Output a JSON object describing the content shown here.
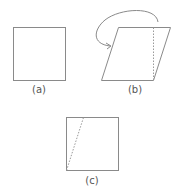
{
  "figures": [
    {
      "id": "a",
      "label": "(a)",
      "shape": "square"
    },
    {
      "id": "b",
      "label": "(b)",
      "shape": "parallelogram",
      "annotation": "curved arrow moving right triangle to left side; dotted vertical cut"
    },
    {
      "id": "c",
      "label": "(c)",
      "shape": "square",
      "annotation": "dotted diagonal from bottom-left corner"
    }
  ],
  "colors": {
    "stroke": "#8a8a8a",
    "dotted": "#9a9a9a"
  }
}
